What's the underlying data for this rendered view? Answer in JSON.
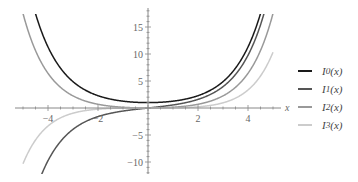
{
  "chart_data": {
    "type": "line",
    "title": "",
    "xlabel": "x",
    "ylabel": "",
    "xlim": [
      -5,
      5
    ],
    "ylim": [
      -12,
      18
    ],
    "x_ticks": [
      -4,
      -2,
      2,
      4
    ],
    "y_ticks": [
      -10,
      -5,
      5,
      10,
      15
    ],
    "grid": false,
    "legend_position": "right",
    "series": [
      {
        "name": "I0(x)",
        "label_main": "I",
        "label_sub": "0",
        "label_arg": "(x)",
        "color": "#1a1a1a",
        "function": "modified Bessel I0"
      },
      {
        "name": "I1(x)",
        "label_main": "I",
        "label_sub": "1",
        "label_arg": "(x)",
        "color": "#555555",
        "function": "modified Bessel I1"
      },
      {
        "name": "I2(x)",
        "label_main": "I",
        "label_sub": "2",
        "label_arg": "(x)",
        "color": "#999999",
        "function": "modified Bessel I2"
      },
      {
        "name": "I3(x)",
        "label_main": "I",
        "label_sub": "3",
        "label_arg": "(x)",
        "color": "#cccccc",
        "function": "modified Bessel I3"
      }
    ]
  }
}
